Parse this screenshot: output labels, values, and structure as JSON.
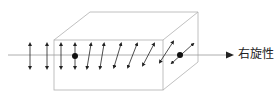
{
  "diagram": {
    "label": "右旋性",
    "colors": {
      "box": "#aaaaaa",
      "axis": "#999999",
      "arrows": "#222222"
    }
  }
}
